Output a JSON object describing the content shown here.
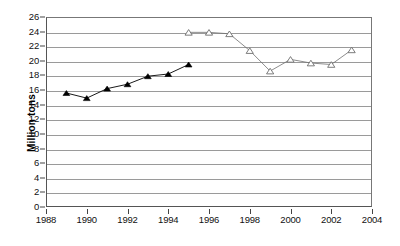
{
  "chart_data": {
    "type": "line",
    "title": "",
    "subtitle": "",
    "xlabel": "",
    "ylabel": "Million tons",
    "xlim": [
      1988,
      2004
    ],
    "ylim": [
      0,
      26
    ],
    "grid": true,
    "legend": "none",
    "x_ticks": [
      1988,
      1990,
      1992,
      1994,
      1996,
      1998,
      2000,
      2002,
      2004
    ],
    "y_ticks": [
      0,
      2,
      4,
      6,
      8,
      10,
      12,
      14,
      16,
      18,
      20,
      22,
      24,
      26
    ],
    "series": [
      {
        "name": "series-1",
        "marker": "filled-triangle",
        "color": "#000000",
        "x": [
          1989,
          1990,
          1991,
          1992,
          1993,
          1994,
          1995
        ],
        "values": [
          15.6,
          14.9,
          16.2,
          16.8,
          17.9,
          18.2,
          19.5
        ]
      },
      {
        "name": "series-2",
        "marker": "open-triangle",
        "color": "#6e6e6e",
        "x": [
          1995,
          1996,
          1997,
          1998,
          1999,
          2000,
          2001,
          2002,
          2003
        ],
        "values": [
          23.9,
          23.9,
          23.7,
          21.4,
          18.6,
          20.2,
          19.7,
          19.5,
          21.5
        ]
      }
    ]
  },
  "colors": {
    "axis": "#555555",
    "gridline": "#9a9a9a",
    "series1": "#000000",
    "series2": "#6e6e6e",
    "background": "#ffffff"
  }
}
